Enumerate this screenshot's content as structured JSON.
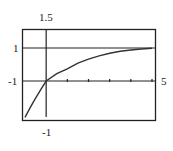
{
  "chart_data": {
    "type": "line",
    "title": "",
    "xlabel": "",
    "ylabel": "",
    "xlim": [
      -1,
      5
    ],
    "ylim": [
      -1,
      1.5
    ],
    "grid": false,
    "legend": null,
    "window_labels": {
      "ymax": "1.5",
      "ymin": "-1",
      "xmin": "-1",
      "xmax": "5",
      "asymptote": "1"
    },
    "x_ticks": [
      1,
      2,
      3,
      4,
      5
    ],
    "horizontal_lines": [
      {
        "y": 1,
        "label": "1"
      }
    ],
    "series": [
      {
        "name": "curve",
        "x": [
          -1,
          -0.75,
          -0.5,
          -0.25,
          0,
          0.5,
          1,
          1.5,
          2,
          2.5,
          3,
          3.5,
          4,
          4.5,
          5
        ],
        "y": [
          -1.1,
          -0.8,
          -0.52,
          -0.25,
          0,
          0.22,
          0.37,
          0.54,
          0.66,
          0.76,
          0.84,
          0.9,
          0.94,
          0.97,
          0.99
        ]
      }
    ]
  },
  "labels": {
    "top": "1.5",
    "left_one": "1",
    "left_minus_one": "-1",
    "right_five": "5",
    "bottom_minus_one": "-1"
  }
}
